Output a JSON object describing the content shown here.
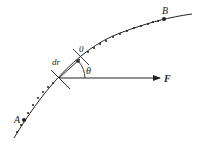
{
  "diagram": {
    "labels": {
      "start_point": "A",
      "end_point": "B",
      "origin": "0",
      "displacement": "dr",
      "angle": "θ",
      "force": "F"
    },
    "colors": {
      "stroke": "#222222",
      "background": "#ffffff"
    }
  }
}
